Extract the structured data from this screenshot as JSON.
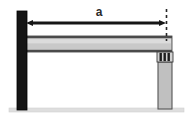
{
  "figure": {
    "kind": "structural-frame-elevation-diagram",
    "background_color": "#ffffff",
    "canvas": {
      "width": 191,
      "height": 120
    }
  },
  "dimension": {
    "label": "a",
    "label_x": 99,
    "label_y": 16,
    "line_y": 23,
    "x_start": 26,
    "x_end": 166,
    "arrow_both_ends": true,
    "color": "#161616",
    "line_width": 3.2
  },
  "extension_line": {
    "name": "right-extension-dashed",
    "x": 166.5,
    "y_top": 9,
    "y_bottom": 41,
    "dash_pattern": "3,3",
    "color": "#262626",
    "width": 1.6
  },
  "left_column": {
    "name": "left-column",
    "x": 17,
    "y": 11,
    "width": 10,
    "height": 99,
    "fill": "#151515",
    "stroke": "#000000"
  },
  "beam": {
    "name": "horizontal-beam",
    "x": 25,
    "y": 36,
    "width": 147,
    "height": 16,
    "fill": "#c9c9c9",
    "stroke": "#3a3a3a",
    "top_edge_color": "#4a4a4a",
    "bottom_edge_color": "#4a4a4a",
    "highlight_color": "#dcdcdc"
  },
  "right_column": {
    "name": "right-column",
    "x": 158,
    "y": 62,
    "width": 14,
    "height": 47,
    "fill": "#c0c0c0",
    "stroke": "#555555"
  },
  "bearing_detail": {
    "name": "beam-column-bearing-connection",
    "x": 157,
    "y": 52,
    "width": 16,
    "height": 10,
    "fill": "#d2d2d2",
    "stroke": "#3c3c3c",
    "bar_color": "#1d1d1d",
    "bar_count": 3,
    "bar_xs": [
      159.5,
      163.5,
      167.5
    ],
    "bar_width": 2.4
  },
  "ground_line": {
    "name": "ground-line",
    "x": 9,
    "y": 108,
    "width": 175,
    "height": 4,
    "fill": "#dedede",
    "stroke": "#cfcfcf"
  }
}
